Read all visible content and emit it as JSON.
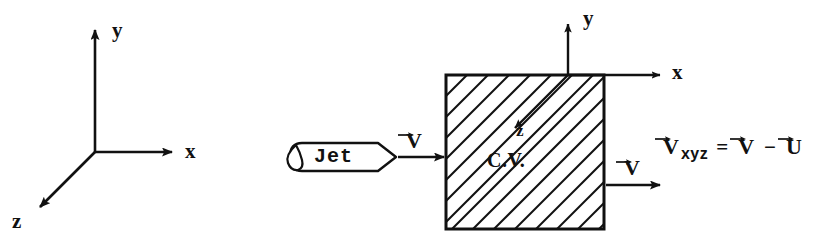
{
  "figure": {
    "background_color": "#ffffff",
    "ink_color": "#111111",
    "width": 832,
    "height": 249
  },
  "global_axes": {
    "name": "global-coordinate-triad",
    "x_label": "x",
    "y_label": "y",
    "z_label": "z",
    "origin": [
      95,
      152
    ]
  },
  "jet": {
    "label": "Jet",
    "velocity_label": "V",
    "velocity_has_vector_arrow": true
  },
  "control_volume": {
    "label": "C.V.",
    "hatched": true,
    "hatch_angle_deg": 45,
    "axes": {
      "x_label": "x",
      "y_label": "y",
      "z_label": "z"
    }
  },
  "outlet": {
    "velocity_label": "V",
    "velocity_has_vector_arrow": true
  },
  "equation": {
    "lhs_symbol": "V",
    "lhs_subscript": "xyz",
    "equals": "=",
    "rhs_first_symbol": "V",
    "operator": "−",
    "rhs_second_symbol": "U",
    "full_text": "V⃗xyz = V⃗ − U⃗"
  }
}
